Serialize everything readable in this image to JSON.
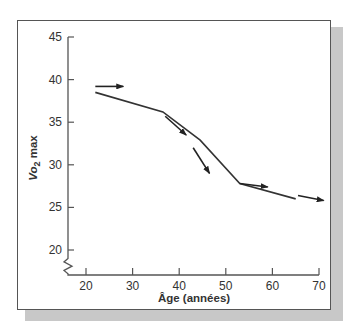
{
  "chart_data": {
    "type": "line",
    "title": "",
    "xlabel": "Âge (années)",
    "ylabel": "Vo2 max",
    "ylabel_main": "Vo",
    "ylabel_sub": "2",
    "ylabel_suffix": " max",
    "xlim": [
      16,
      70
    ],
    "ylim": [
      18,
      45
    ],
    "x_ticks": [
      20,
      30,
      40,
      50,
      60,
      70
    ],
    "y_ticks": [
      20,
      25,
      30,
      35,
      40,
      45
    ],
    "x_tick_labels": [
      "20",
      "30",
      "40",
      "50",
      "60",
      "70"
    ],
    "y_tick_labels": [
      "20",
      "25",
      "30",
      "35",
      "40",
      "45"
    ],
    "axis_break": "y-axis below 20",
    "grid": false,
    "legend": null,
    "series": [
      {
        "name": "Vo2 max",
        "x": [
          22,
          36.5,
          44.5,
          53,
          65
        ],
        "y": [
          38.5,
          36.2,
          32.9,
          27.8,
          26.0
        ]
      }
    ],
    "annotations": [
      {
        "type": "arrow",
        "description": "rate-of-change arrow",
        "from": [
          22,
          39.2
        ],
        "to": [
          28,
          39.2
        ]
      },
      {
        "type": "arrow",
        "description": "rate-of-change arrow",
        "from": [
          37,
          35.7
        ],
        "to": [
          41.5,
          33.5
        ]
      },
      {
        "type": "arrow",
        "description": "rate-of-change arrow",
        "from": [
          43,
          32.0
        ],
        "to": [
          46.5,
          29.0
        ]
      },
      {
        "type": "arrow",
        "description": "rate-of-change arrow",
        "from": [
          53,
          27.8
        ],
        "to": [
          59,
          27.4
        ]
      },
      {
        "type": "arrow",
        "description": "rate-of-change arrow",
        "from": [
          65.5,
          26.4
        ],
        "to": [
          71,
          25.8
        ]
      }
    ]
  }
}
